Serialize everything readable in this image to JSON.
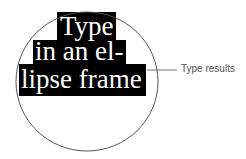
{
  "figure": {
    "lines": [
      "Type",
      "in an el-",
      "lipse frame"
    ],
    "callout_label": "Type results",
    "colors": {
      "text_block_bg": "#000000",
      "text_color": "#ffffff",
      "ellipse_stroke": "#555555",
      "callout_line": "#777777",
      "label_color": "#555555"
    }
  }
}
